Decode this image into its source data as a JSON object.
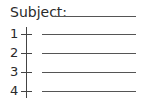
{
  "subject": {
    "label": "Subject:"
  },
  "rows": [
    {
      "number": "1"
    },
    {
      "number": "2"
    },
    {
      "number": "3"
    },
    {
      "number": "4"
    }
  ]
}
